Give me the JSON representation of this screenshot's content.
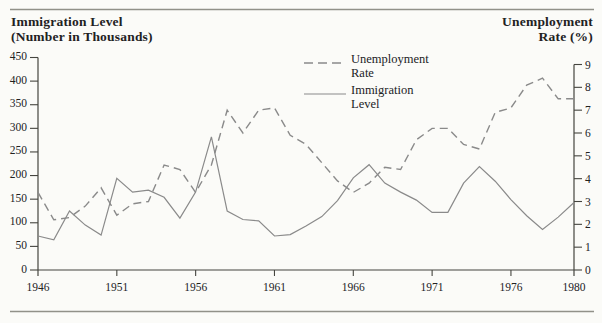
{
  "header": {
    "left_title_line1": "Immigration Level",
    "left_title_line2": "(Number in Thousands)",
    "right_title_line1": "Unemployment",
    "right_title_line2": "Rate (%)"
  },
  "legend": [
    {
      "style": "dashed",
      "label_line1": "Unemployment",
      "label_line2": "Rate"
    },
    {
      "style": "solid",
      "label_line1": "Immigration",
      "label_line2": "Level"
    }
  ],
  "chart_data": {
    "type": "line",
    "x": [
      1946,
      1947,
      1948,
      1949,
      1950,
      1951,
      1952,
      1953,
      1954,
      1955,
      1956,
      1957,
      1958,
      1959,
      1960,
      1961,
      1962,
      1963,
      1964,
      1965,
      1966,
      1967,
      1968,
      1969,
      1970,
      1971,
      1972,
      1973,
      1974,
      1975,
      1976,
      1977,
      1978,
      1979,
      1980
    ],
    "series": [
      {
        "name": "Unemployment Rate",
        "axis": "right",
        "line_style": "dashed",
        "values": [
          3.4,
          2.2,
          2.3,
          2.8,
          3.6,
          2.4,
          2.9,
          3.0,
          4.6,
          4.4,
          3.4,
          4.6,
          7.0,
          6.0,
          7.0,
          7.1,
          5.9,
          5.5,
          4.7,
          3.9,
          3.4,
          3.8,
          4.5,
          4.4,
          5.7,
          6.2,
          6.2,
          5.5,
          5.3,
          6.9,
          7.1,
          8.1,
          8.4,
          7.5,
          7.5
        ]
      },
      {
        "name": "Immigration Level",
        "axis": "left",
        "line_style": "solid",
        "values": [
          72,
          64,
          125,
          95,
          74,
          194,
          165,
          169,
          154,
          110,
          165,
          282,
          125,
          107,
          104,
          72,
          75,
          93,
          113,
          147,
          195,
          223,
          184,
          165,
          148,
          122,
          122,
          184,
          219,
          188,
          149,
          115,
          86,
          112,
          143
        ]
      }
    ],
    "left_axis": {
      "title": "Immigration Level (Number in Thousands)",
      "range": [
        0,
        450
      ],
      "ticks": [
        0,
        50,
        100,
        150,
        200,
        250,
        300,
        350,
        400,
        450
      ]
    },
    "right_axis": {
      "title": "Unemployment Rate (%)",
      "range": [
        0,
        9
      ],
      "ticks": [
        0,
        1,
        2,
        3,
        4,
        5,
        6,
        7,
        8,
        9
      ]
    },
    "x_axis": {
      "range": [
        1946,
        1980
      ],
      "tick_labels": [
        "1946",
        "1951",
        "1956",
        "1961",
        "1966",
        "1971",
        "1976",
        "1980"
      ]
    },
    "grid": false,
    "legend_position": "top-center",
    "colors": {
      "curve": "#8a8a8a",
      "axis": "#45453f",
      "text": "#22221f",
      "rule": "#919189",
      "background": "#fbfbf8"
    }
  }
}
